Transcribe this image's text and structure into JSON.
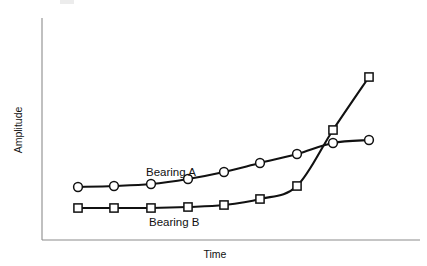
{
  "figure": {
    "background_color": "#ffffff",
    "axis_color": "#8c8c8c",
    "line_color": "#111111",
    "marker_fill": "#ffffff"
  },
  "axes": {
    "y_label": "Amplitude",
    "x_label": "Time"
  },
  "annotations": {
    "series_a_label": "Bearing A",
    "series_b_label": "Bearing B"
  },
  "chart_data": {
    "type": "line",
    "title": "",
    "xlabel": "Time",
    "ylabel": "Amplitude",
    "grid": false,
    "legend_position": "inline-annotation",
    "axis_ticks": {
      "x": [],
      "y": []
    },
    "xlim": [
      0,
      10
    ],
    "ylim": [
      0,
      10
    ],
    "x": [
      1,
      2,
      3,
      4,
      5,
      6,
      7,
      8,
      9
    ],
    "series": [
      {
        "name": "Bearing A",
        "marker": "circle",
        "values": [
          2.6,
          2.65,
          2.8,
          3.1,
          3.6,
          4.2,
          4.8,
          5.5,
          5.7
        ]
      },
      {
        "name": "Bearing B",
        "marker": "square",
        "values": [
          1.2,
          1.2,
          1.2,
          1.25,
          1.4,
          1.8,
          2.6,
          6.3,
          9.2
        ]
      }
    ]
  },
  "geometry": {
    "plot_left": 42,
    "plot_right": 420,
    "plot_top": 18,
    "plot_bottom": 240,
    "series_a_points": [
      [
        78,
        187
      ],
      [
        114,
        186
      ],
      [
        151,
        184
      ],
      [
        188,
        179
      ],
      [
        224,
        172
      ],
      [
        260,
        163
      ],
      [
        297,
        154
      ],
      [
        333,
        143
      ],
      [
        369,
        140
      ]
    ],
    "series_b_points": [
      [
        78,
        208
      ],
      [
        114,
        208
      ],
      [
        151,
        208
      ],
      [
        188,
        207
      ],
      [
        224,
        205
      ],
      [
        260,
        199
      ],
      [
        297,
        186
      ],
      [
        333,
        130
      ],
      [
        369,
        77
      ]
    ],
    "label_a_pos": [
      146,
      176
    ],
    "label_b_pos": [
      149,
      226
    ],
    "ylabel_pos": [
      22,
      130
    ],
    "xlabel_pos": [
      215,
      258
    ]
  }
}
